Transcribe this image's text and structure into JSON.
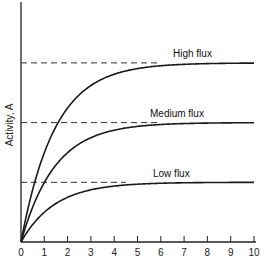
{
  "chart_data": {
    "type": "line",
    "title": "",
    "xlabel": "",
    "ylabel": "Activity, A",
    "x_ticks": [
      0,
      1,
      2,
      3,
      4,
      5,
      6,
      7,
      8,
      9,
      10
    ],
    "xlim": [
      0,
      10
    ],
    "ylim": [
      0,
      3.0
    ],
    "y_ticks": [],
    "grid": false,
    "legend": "inline labels above plateaus",
    "model": "A = Amax * (1 - exp(-t / 1.45))",
    "series": [
      {
        "name": "High flux",
        "plateau": 3,
        "x": [
          0,
          1,
          2,
          3,
          4,
          5,
          6,
          7,
          8,
          9,
          10
        ],
        "values": [
          0,
          1.49,
          2.25,
          2.62,
          2.81,
          2.9,
          2.95,
          2.98,
          2.99,
          2.99,
          3.0
        ]
      },
      {
        "name": "Medium flux",
        "plateau": 2,
        "x": [
          0,
          1,
          2,
          3,
          4,
          5,
          6,
          7,
          8,
          9,
          10
        ],
        "values": [
          0,
          0.99,
          1.5,
          1.75,
          1.87,
          1.94,
          1.97,
          1.98,
          1.99,
          2.0,
          2.0
        ]
      },
      {
        "name": "Low flux",
        "plateau": 1,
        "x": [
          0,
          1,
          2,
          3,
          4,
          5,
          6,
          7,
          8,
          9,
          10
        ],
        "values": [
          0,
          0.5,
          0.75,
          0.87,
          0.94,
          0.97,
          0.98,
          0.99,
          1.0,
          1.0,
          1.0
        ]
      }
    ],
    "annotations": [
      {
        "type": "dashed-hline",
        "y": 3,
        "x_end": 6
      },
      {
        "type": "dashed-hline",
        "y": 2,
        "x_end": 6
      },
      {
        "type": "dashed-hline",
        "y": 1,
        "x_end": 4.5
      }
    ]
  },
  "labels": {
    "y_axis": "Activity, A",
    "high": "High flux",
    "medium": "Medium flux",
    "low": "Low flux"
  }
}
